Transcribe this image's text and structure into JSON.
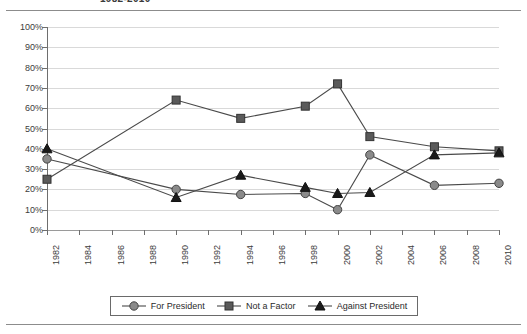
{
  "title": "1982-2010",
  "chart_data": {
    "type": "line",
    "title": "1982-2010",
    "xlabel": "",
    "ylabel": "",
    "ylim": [
      0,
      100
    ],
    "ytick_labels": [
      "100%",
      "90%",
      "80%",
      "70%",
      "60%",
      "50%",
      "40%",
      "30%",
      "20%",
      "10%",
      "0%"
    ],
    "ytick_values": [
      100,
      90,
      80,
      70,
      60,
      50,
      40,
      30,
      20,
      10,
      0
    ],
    "grid": true,
    "legend_position": "bottom",
    "categories": [
      "1982",
      "1984",
      "1986",
      "1988",
      "1990",
      "1992",
      "1994",
      "1996",
      "1998",
      "2000",
      "2002",
      "2004",
      "2006",
      "2008",
      "2010"
    ],
    "x": [
      1982,
      1990,
      1994,
      1998,
      2000,
      2002,
      2006,
      2010
    ],
    "series": [
      {
        "name": "For President",
        "marker": "circle",
        "color": "#8a8a8a",
        "x": [
          1982,
          1990,
          1994,
          1998,
          2000,
          2002,
          2006,
          2010
        ],
        "values": [
          35,
          20,
          17.5,
          18,
          10,
          37,
          22,
          23
        ]
      },
      {
        "name": "Not a Factor",
        "marker": "square",
        "color": "#5a5a5a",
        "x": [
          1982,
          1990,
          1994,
          1998,
          2000,
          2002,
          2006,
          2010
        ],
        "values": [
          25,
          64,
          55,
          61,
          72,
          46,
          41,
          39
        ]
      },
      {
        "name": "Against President",
        "marker": "triangle",
        "color": "#1a1a1a",
        "x": [
          1982,
          1990,
          1994,
          1998,
          2000,
          2002,
          2006,
          2010
        ],
        "values": [
          40,
          16,
          27,
          21,
          18,
          18.5,
          37,
          38
        ]
      }
    ]
  },
  "legend": {
    "items": [
      {
        "label": "For President",
        "marker": "circle"
      },
      {
        "label": "Not a Factor",
        "marker": "square"
      },
      {
        "label": "Against President",
        "marker": "triangle"
      }
    ]
  }
}
